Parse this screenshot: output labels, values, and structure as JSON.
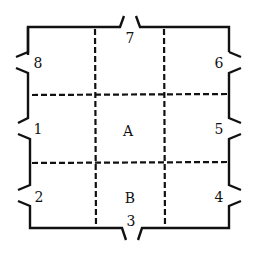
{
  "diagram": {
    "type": "floor-plan-grid",
    "stroke_color": "#111111",
    "background": "#ffffff",
    "rooms": [
      {
        "id": "A",
        "label": "A",
        "x": 128,
        "y": 136
      },
      {
        "id": "B",
        "label": "B",
        "x": 129,
        "y": 202
      }
    ],
    "openings": [
      {
        "id": "1",
        "label": "1",
        "side": "left",
        "x": 33,
        "y": 134
      },
      {
        "id": "2",
        "label": "2",
        "side": "left",
        "x": 35,
        "y": 202
      },
      {
        "id": "3",
        "label": "3",
        "side": "bottom",
        "x": 131,
        "y": 227
      },
      {
        "id": "4",
        "label": "4",
        "side": "right",
        "x": 218,
        "y": 202
      },
      {
        "id": "5",
        "label": "5",
        "side": "right",
        "x": 218,
        "y": 134
      },
      {
        "id": "6",
        "label": "6",
        "side": "right",
        "x": 218,
        "y": 68
      },
      {
        "id": "7",
        "label": "7",
        "side": "top",
        "x": 130,
        "y": 43
      },
      {
        "id": "8",
        "label": "8",
        "side": "left",
        "x": 35,
        "y": 68
      }
    ],
    "grid": {
      "columns": 3,
      "rows": 3,
      "vertical_dividers_x": [
        95,
        164
      ],
      "horizontal_dividers_y": [
        95,
        162
      ],
      "style": "dashed"
    }
  }
}
